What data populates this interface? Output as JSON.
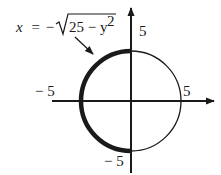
{
  "figure": {
    "equation": {
      "lhs": "x",
      "eq": "=",
      "neg": "−",
      "radicand": "25 − y",
      "exp": "2"
    },
    "circle": {
      "radius": 5,
      "center": [
        0,
        0
      ]
    },
    "highlighted_arc": "left semicircle",
    "labels": {
      "x_neg": "− 5",
      "x_pos": "5",
      "y_pos": "5",
      "y_neg": "− 5"
    },
    "colors": {
      "stroke": "#1a1a1a",
      "background": "#ffffff"
    }
  }
}
